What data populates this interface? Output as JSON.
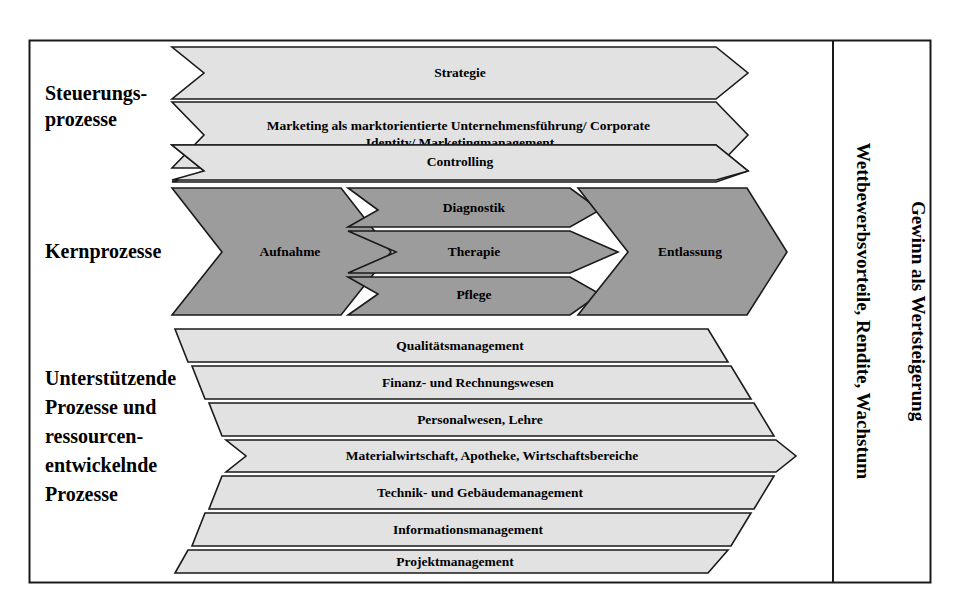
{
  "frame": {
    "border_color": "#000000",
    "background": "#ffffff"
  },
  "colors": {
    "light_band": "#e2e2e2",
    "dark_band": "#9c9c9c",
    "outline": "#1a1a1a",
    "text": "#000000"
  },
  "sections": [
    {
      "id": "steuerungsprozesse",
      "label_lines": [
        "Steuerungs-",
        "prozesse"
      ],
      "fill": "light",
      "bands": [
        {
          "id": "strategie",
          "label": "Strategie",
          "lines": [
            "Strategie"
          ]
        },
        {
          "id": "marketing",
          "label": "Marketing als marktorientierte Unternehmensführung/ Corporate Identity/ Marketingmanagement",
          "lines": [
            "Marketing als marktorientierte Unternehmensführung/ Corporate",
            "Identity/ Marketingmanagement"
          ]
        },
        {
          "id": "controlling",
          "label": "Controlling",
          "lines": [
            "Controlling"
          ]
        }
      ]
    },
    {
      "id": "kernprozesse",
      "label_lines": [
        "Kernprozesse"
      ],
      "fill": "dark",
      "bands": [
        {
          "id": "aufnahme",
          "label": "Aufnahme",
          "lines": [
            "Aufnahme"
          ]
        },
        {
          "id": "diagnostik",
          "label": "Diagnostik",
          "lines": [
            "Diagnostik"
          ]
        },
        {
          "id": "therapie",
          "label": "Therapie",
          "lines": [
            "Therapie"
          ]
        },
        {
          "id": "pflege",
          "label": "Pflege",
          "lines": [
            "Pflege"
          ]
        },
        {
          "id": "entlassung",
          "label": "Entlassung",
          "lines": [
            "Entlassung"
          ]
        }
      ]
    },
    {
      "id": "unterstuetzende-prozesse",
      "label_lines": [
        "Unterstützende",
        "Prozesse und",
        "ressourcen-",
        "entwickelnde",
        "Prozesse"
      ],
      "fill": "light",
      "bands": [
        {
          "id": "qualitaetsmanagement",
          "label": "Qualitätsmanagement",
          "lines": [
            "Qualitätsmanagement"
          ]
        },
        {
          "id": "finanz-rechnungswesen",
          "label": "Finanz- und Rechnungswesen",
          "lines": [
            "Finanz- und Rechnungswesen"
          ]
        },
        {
          "id": "personalwesen-lehre",
          "label": "Personalwesen, Lehre",
          "lines": [
            "Personalwesen, Lehre"
          ]
        },
        {
          "id": "materialwirtschaft",
          "label": "Materialwirtschaft, Apotheke, Wirtschaftsbereiche",
          "lines": [
            "Materialwirtschaft, Apotheke, Wirtschaftsbereiche"
          ]
        },
        {
          "id": "technik-gebaeudemanagement",
          "label": "Technik- und Gebäudemanagement",
          "lines": [
            "Technik- und Gebäudemanagement"
          ]
        },
        {
          "id": "informationsmanagement",
          "label": "Informationsmanagement",
          "lines": [
            "Informationsmanagement"
          ]
        },
        {
          "id": "projektmanagement",
          "label": "Projektmanagement",
          "lines": [
            "Projektmanagement"
          ]
        }
      ]
    }
  ],
  "outcomes": [
    {
      "id": "wettbewerbsvorteile",
      "label": "Wettbewerbsvorteile, Rendite, Wachstum"
    },
    {
      "id": "gewinn",
      "label": "Gewinn als Wertsteigerung"
    }
  ]
}
